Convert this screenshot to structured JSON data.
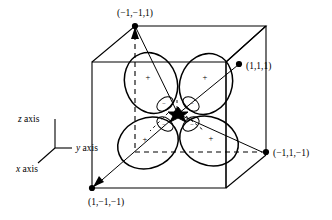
{
  "figure": {
    "background_color": "#ffffff",
    "ink_color": "#000000"
  },
  "vertices": [
    {
      "id": "top-back",
      "label": "(−1,−1,1)",
      "x": -1,
      "y": -1,
      "z": 1
    },
    {
      "id": "top-right",
      "label": "(1,1,1)",
      "x": 1,
      "y": 1,
      "z": 1
    },
    {
      "id": "right-bottom",
      "label": "(−1,1,−1)",
      "x": -1,
      "y": 1,
      "z": -1
    },
    {
      "id": "front-bottom",
      "label": "(1,−1,−1)",
      "x": 1,
      "y": -1,
      "z": -1
    }
  ],
  "axes": {
    "z": {
      "label_parts": {
        "letter": "z",
        "word": " axis"
      },
      "label": "z axis"
    },
    "y": {
      "label_parts": {
        "letter": "y",
        "word": " axis"
      },
      "label": "y axis"
    },
    "x": {
      "label_parts": {
        "letter": "x",
        "word": " axis"
      },
      "label": "x axis"
    }
  },
  "lobes": [
    {
      "id": "lobe-upper-left",
      "sign": "+"
    },
    {
      "id": "lobe-upper-right",
      "sign": "+"
    },
    {
      "id": "lobe-lower-left",
      "sign": "+"
    },
    {
      "id": "lobe-lower-right",
      "sign": "+"
    }
  ],
  "inner_lobes": [
    {
      "id": "inner-upper-left",
      "sign": "−"
    },
    {
      "id": "inner-upper-right",
      "sign": "−"
    },
    {
      "id": "inner-lower-left",
      "sign": "−"
    },
    {
      "id": "inner-lower-right",
      "sign": "−"
    }
  ]
}
